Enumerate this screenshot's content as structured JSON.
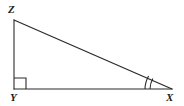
{
  "figure": {
    "type": "geometric-diagram",
    "shape": "right-triangle",
    "background_color": "#ffffff",
    "stroke_color": "#2b2b2b",
    "canvas": {
      "width": 184,
      "height": 106
    },
    "vertices": [
      {
        "id": "Z",
        "label": "Z",
        "x": 14,
        "y": 20,
        "label_x": 8,
        "label_y": 4
      },
      {
        "id": "Y",
        "label": "Y",
        "x": 14,
        "y": 89,
        "label_x": 10,
        "label_y": 92
      },
      {
        "id": "X",
        "label": "X",
        "x": 172,
        "y": 89,
        "label_x": 166,
        "label_y": 92
      }
    ],
    "sides": [
      {
        "id": "ZY",
        "from": "Z",
        "to": "Y",
        "role": "vertical-leg"
      },
      {
        "id": "YX",
        "from": "Y",
        "to": "X",
        "role": "horizontal-leg"
      },
      {
        "id": "ZX",
        "from": "Z",
        "to": "X",
        "role": "hypotenuse"
      }
    ],
    "angle_marks": [
      {
        "id": "angle-Y",
        "at": "Y",
        "kind": "right-angle-square",
        "size": 11
      },
      {
        "id": "angle-X",
        "at": "X",
        "kind": "double-arc",
        "ticks": 2
      }
    ]
  }
}
